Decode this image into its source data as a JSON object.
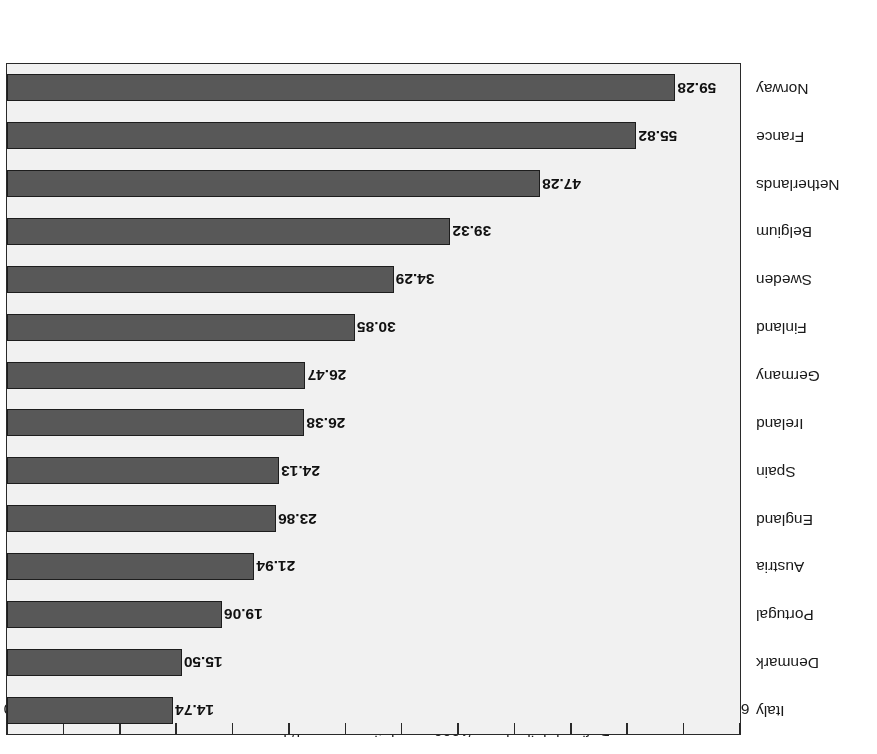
{
  "chart_data": {
    "type": "bar",
    "orientation": "horizontal",
    "rotated_180": true,
    "title": "",
    "xlabel": "Defined daily doses/1000 population covered/day",
    "ylabel": "",
    "xlim": [
      0,
      65
    ],
    "xticks": [
      0,
      5,
      10,
      15,
      20,
      25,
      30,
      35,
      40,
      45,
      50,
      55,
      60,
      65
    ],
    "xtick_labels": [
      "0",
      "5",
      "10",
      "15",
      "20",
      "25",
      "30",
      "35",
      "40",
      "45",
      "50",
      "55",
      "60",
      "65"
    ],
    "grid": false,
    "legend": null,
    "bar_color": "#585858",
    "bar_edge_color": "#1d1d1d",
    "plot_background": "#f1f1f1",
    "categories": [
      "Italy",
      "Denmark",
      "Portugal",
      "Austria",
      "England",
      "Spain",
      "Ireland",
      "Germany",
      "Finland",
      "Sweden",
      "Belgium",
      "Netherlands",
      "France",
      "Norway"
    ],
    "values": [
      14.74,
      15.5,
      19.06,
      21.94,
      23.86,
      24.13,
      26.38,
      26.47,
      30.85,
      34.29,
      39.32,
      47.28,
      55.82,
      59.28
    ],
    "value_labels": [
      "14.74",
      "15.50",
      "19.06",
      "21.94",
      "23.86",
      "24.13",
      "26.38",
      "26.47",
      "30.85",
      "34.29",
      "39.32",
      "47.28",
      "55.82",
      "59.28"
    ]
  }
}
